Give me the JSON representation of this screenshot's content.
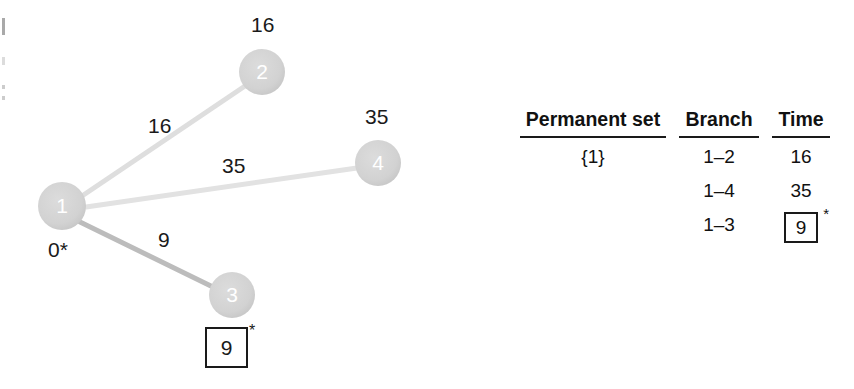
{
  "figure": {
    "type": "shortest-path-graph-with-iteration-table",
    "graph": {
      "nodes": [
        {
          "id": "1",
          "label": "1",
          "annotation": "0*",
          "cx": 62,
          "cy": 206,
          "r": 24
        },
        {
          "id": "2",
          "label": "2",
          "annotation": "16",
          "cx": 262,
          "cy": 72,
          "r": 23
        },
        {
          "id": "3",
          "label": "3",
          "annotation": "9",
          "cx": 232,
          "cy": 295,
          "r": 23
        },
        {
          "id": "4",
          "label": "4",
          "annotation": "35",
          "cx": 378,
          "cy": 163,
          "r": 23
        }
      ],
      "edges": [
        {
          "from": "1",
          "to": "2",
          "weight": "16"
        },
        {
          "from": "1",
          "to": "4",
          "weight": "35"
        },
        {
          "from": "1",
          "to": "3",
          "weight": "9"
        }
      ],
      "node1_annotation": "0*",
      "node2_annotation": "16",
      "node4_annotation": "35",
      "node3_boxed_value": "9",
      "node3_star": "*",
      "edge_label_1_2": "16",
      "edge_label_1_4": "35",
      "edge_label_1_3": "9",
      "colors": {
        "node_fill": "#d2d2d2",
        "node_text": "#ffffff",
        "edge_light": "#dcdcdc",
        "edge_dark": "#b4b4b4",
        "text": "#1a1a1a"
      }
    },
    "table": {
      "headers": {
        "permanent_set": "Permanent set",
        "branch": "Branch",
        "time": "Time"
      },
      "rows": [
        {
          "permanent_set": "{1}",
          "branch": "1–2",
          "time": "16",
          "boxed": false,
          "star": ""
        },
        {
          "permanent_set": "",
          "branch": "1–4",
          "time": "35",
          "boxed": false,
          "star": ""
        },
        {
          "permanent_set": "",
          "branch": "1–3",
          "time": "9",
          "boxed": true,
          "star": "*"
        }
      ]
    }
  }
}
